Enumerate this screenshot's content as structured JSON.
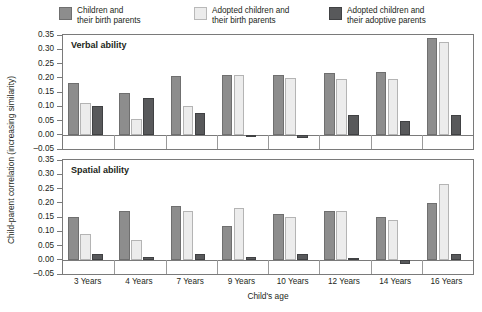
{
  "legend": {
    "items": [
      {
        "label": "Children and\ntheir birth parents",
        "color": "#8d8d8d",
        "key": "children-birth-parents"
      },
      {
        "label": "Adopted children and\ntheir birth parents",
        "color": "#ececec",
        "key": "adopted-birth-parents"
      },
      {
        "label": "Adopted children and\ntheir adoptive parents",
        "color": "#58595b",
        "key": "adopted-adoptive-parents"
      }
    ]
  },
  "axes": {
    "y_title": "Child-parent correlation (increasing similarity)",
    "x_title": "Child's age",
    "y_ticks": [
      "0.35",
      "0.30",
      "0.25",
      "0.20",
      "0.15",
      "0.10",
      "0.05",
      "0.00",
      "–0.05"
    ]
  },
  "panels": [
    {
      "title": "Verbal ability"
    },
    {
      "title": "Spatial ability"
    }
  ],
  "chart_data": {
    "type": "bar",
    "title": "",
    "xlabel": "Child's age",
    "ylabel": "Child-parent correlation (increasing similarity)",
    "ylim": [
      -0.05,
      0.35
    ],
    "ytick_values": [
      0.35,
      0.3,
      0.25,
      0.2,
      0.15,
      0.1,
      0.05,
      0.0,
      -0.05
    ],
    "grid": false,
    "legend_position": "top",
    "categories": [
      "3 Years",
      "4 Years",
      "7 Years",
      "9 Years",
      "10 Years",
      "12 Years",
      "14 Years",
      "16 Years"
    ],
    "panels": [
      {
        "title": "Verbal ability",
        "series": [
          {
            "name": "Children and their birth parents",
            "color": "#8d8d8d",
            "values": [
              0.18,
              0.145,
              0.205,
              0.21,
              0.21,
              0.215,
              0.22,
              0.34
            ]
          },
          {
            "name": "Adopted children and their birth parents",
            "color": "#ececec",
            "values": [
              0.11,
              0.055,
              0.1,
              0.21,
              0.2,
              0.195,
              0.195,
              0.325
            ]
          },
          {
            "name": "Adopted children and their adoptive parents",
            "color": "#58595b",
            "values": [
              0.1,
              0.13,
              0.075,
              0.0,
              -0.01,
              0.07,
              0.05,
              0.07
            ]
          }
        ]
      },
      {
        "title": "Spatial ability",
        "series": [
          {
            "name": "Children and their birth parents",
            "color": "#8d8d8d",
            "values": [
              0.15,
              0.17,
              0.19,
              0.12,
              0.16,
              0.17,
              0.15,
              0.2
            ]
          },
          {
            "name": "Adopted children and their birth parents",
            "color": "#ececec",
            "values": [
              0.09,
              0.07,
              0.17,
              0.18,
              0.15,
              0.17,
              0.14,
              0.265
            ]
          },
          {
            "name": "Adopted children and their adoptive parents",
            "color": "#58595b",
            "values": [
              0.02,
              0.01,
              0.02,
              0.01,
              0.02,
              0.005,
              -0.015,
              0.02
            ]
          }
        ]
      }
    ]
  }
}
